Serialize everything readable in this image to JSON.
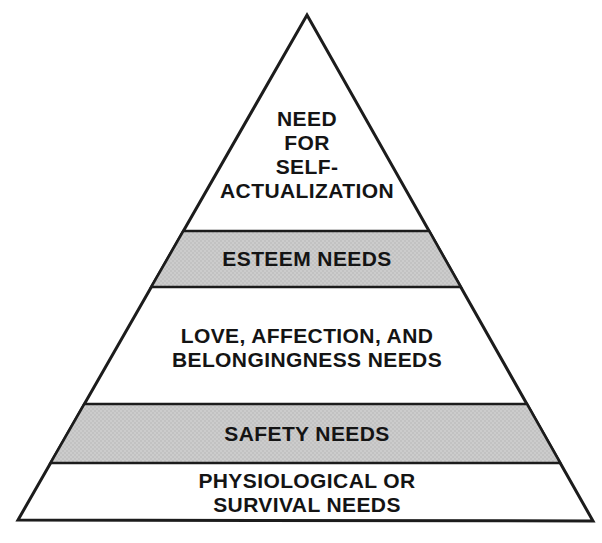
{
  "diagram": {
    "type": "pyramid-hierarchy",
    "levels": [
      {
        "rank": 1,
        "position": "top",
        "label": "NEED\nFOR\nSELF-\nACTUALIZATION",
        "shaded": false
      },
      {
        "rank": 2,
        "position": "second",
        "label": "ESTEEM NEEDS",
        "shaded": true
      },
      {
        "rank": 3,
        "position": "middle",
        "label": "LOVE, AFFECTION, AND\nBELONGINGNESS NEEDS",
        "shaded": false
      },
      {
        "rank": 4,
        "position": "fourth",
        "label": "SAFETY NEEDS",
        "shaded": true
      },
      {
        "rank": 5,
        "position": "base",
        "label": "PHYSIOLOGICAL OR SURVIVAL NEEDS",
        "shaded": false
      }
    ],
    "colors": {
      "background": "#ffffff",
      "outline": "#1c1c1c",
      "shaded_band_base": "#cccccc",
      "shaded_band_dot": "#b0b0b0",
      "text": "#141414"
    }
  }
}
